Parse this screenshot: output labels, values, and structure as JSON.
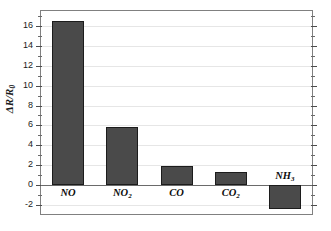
{
  "chart_data": {
    "type": "bar",
    "title": "",
    "subtitle": "",
    "xlabel": "",
    "ylabel": "ΔR/R₀",
    "ylabel_main": "ΔR/R",
    "ylabel_sub": "0",
    "categories": [
      "NO",
      "NO2",
      "CO",
      "CO2",
      "NH3"
    ],
    "category_labels": [
      {
        "base": "NO",
        "sub": ""
      },
      {
        "base": "NO",
        "sub": "2"
      },
      {
        "base": "CO",
        "sub": ""
      },
      {
        "base": "CO",
        "sub": "2"
      },
      {
        "base": "NH",
        "sub": "3"
      }
    ],
    "values": [
      16.5,
      5.8,
      1.95,
      1.3,
      -2.4
    ],
    "ylim": [
      -2.9,
      17.5
    ],
    "yticks": [
      16,
      14,
      12,
      10,
      8,
      6,
      4,
      2,
      0,
      -2
    ],
    "ytick_labels": [
      "16",
      "14",
      "12",
      "10",
      "8",
      "6",
      "4",
      "2",
      "0",
      "-2"
    ],
    "yminor_step": 1,
    "grid": true,
    "grid_axis": "y",
    "legend": "none",
    "bar_color": "#4a4a4a",
    "bar_edge_color": "#1c1c1c",
    "grid_color": "#e6e6e6",
    "axis_color": "#808080",
    "zero_line_color": "#6a6a6a",
    "background_color": "#ffffff"
  }
}
